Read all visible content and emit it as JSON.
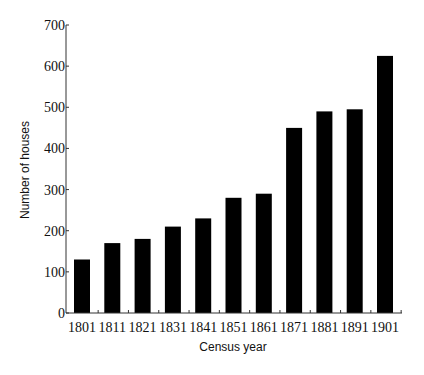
{
  "chart_data": {
    "type": "bar",
    "title": "",
    "xlabel": "Census year",
    "ylabel": "Number of houses",
    "categories": [
      "1801",
      "1811",
      "1821",
      "1831",
      "1841",
      "1851",
      "1861",
      "1871",
      "1881",
      "1891",
      "1901"
    ],
    "values": [
      130,
      170,
      180,
      210,
      230,
      280,
      290,
      450,
      490,
      495,
      625
    ],
    "ylim": [
      0,
      700
    ],
    "yticks": [
      0,
      100,
      200,
      300,
      400,
      500,
      600,
      700
    ],
    "grid": false,
    "legend": null,
    "bar_color": "#000000"
  }
}
